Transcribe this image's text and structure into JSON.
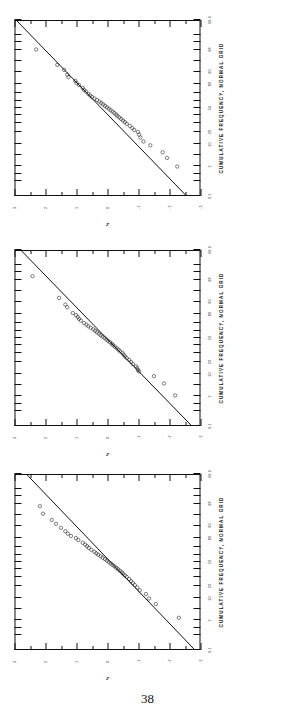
{
  "page": {
    "number": "38"
  },
  "axis": {
    "x_title": "CUMULATIVE FREQUENCY, NORMAL GRID",
    "y_title": "z",
    "x_ticks": [
      "0.1",
      "2",
      "10",
      "20",
      "50",
      "80",
      "90",
      "98",
      "99.9"
    ],
    "y_ticks": [
      "-3",
      "-2",
      "-1",
      "0",
      "1",
      "2",
      "3"
    ]
  },
  "chart_data": [
    {
      "type": "scatter",
      "title": "",
      "subtitle": "Normal probability plot A",
      "xlabel": "CUMULATIVE FREQUENCY, NORMAL GRID",
      "ylabel": "z",
      "xscale": "probability",
      "xlim": [
        0.1,
        99.9
      ],
      "ylim": [
        -3,
        3
      ],
      "grid": false,
      "legend": "none",
      "xticks": [
        0.1,
        2,
        10,
        20,
        50,
        80,
        90,
        98,
        99.9
      ],
      "yticks": [
        -3,
        -2,
        -1,
        0,
        1,
        2,
        3
      ],
      "fit_line": {
        "x": [
          0.1,
          99.9
        ],
        "y": [
          -2.55,
          2.95
        ]
      },
      "points": [
        {
          "p": 2.0,
          "z": -2.25
        },
        {
          "p": 4.0,
          "z": -1.92
        },
        {
          "p": 6.0,
          "z": -1.78
        },
        {
          "p": 9.5,
          "z": -1.38
        },
        {
          "p": 12.0,
          "z": -1.16
        },
        {
          "p": 15.0,
          "z": -1.06
        },
        {
          "p": 17.5,
          "z": -1.02
        },
        {
          "p": 20.0,
          "z": -0.98
        },
        {
          "p": 22.0,
          "z": -0.86
        },
        {
          "p": 24.0,
          "z": -0.8
        },
        {
          "p": 26.5,
          "z": -0.72
        },
        {
          "p": 29.0,
          "z": -0.62
        },
        {
          "p": 31.0,
          "z": -0.56
        },
        {
          "p": 33.0,
          "z": -0.5
        },
        {
          "p": 35.0,
          "z": -0.44
        },
        {
          "p": 37.0,
          "z": -0.38
        },
        {
          "p": 39.0,
          "z": -0.32
        },
        {
          "p": 41.0,
          "z": -0.28
        },
        {
          "p": 43.0,
          "z": -0.22
        },
        {
          "p": 45.0,
          "z": -0.16
        },
        {
          "p": 47.0,
          "z": -0.1
        },
        {
          "p": 49.0,
          "z": -0.04
        },
        {
          "p": 51.0,
          "z": 0.02
        },
        {
          "p": 53.0,
          "z": 0.08
        },
        {
          "p": 55.0,
          "z": 0.14
        },
        {
          "p": 57.0,
          "z": 0.2
        },
        {
          "p": 59.0,
          "z": 0.26
        },
        {
          "p": 61.0,
          "z": 0.34
        },
        {
          "p": 63.0,
          "z": 0.42
        },
        {
          "p": 65.0,
          "z": 0.5
        },
        {
          "p": 67.0,
          "z": 0.56
        },
        {
          "p": 69.0,
          "z": 0.62
        },
        {
          "p": 72.0,
          "z": 0.7
        },
        {
          "p": 74.0,
          "z": 0.76
        },
        {
          "p": 76.0,
          "z": 0.8
        },
        {
          "p": 79.0,
          "z": 0.92
        },
        {
          "p": 81.0,
          "z": 1.0
        },
        {
          "p": 83.0,
          "z": 1.04
        },
        {
          "p": 86.0,
          "z": 1.26
        },
        {
          "p": 88.0,
          "z": 1.3
        },
        {
          "p": 91.0,
          "z": 1.4
        },
        {
          "p": 93.5,
          "z": 1.62
        },
        {
          "p": 98.0,
          "z": 2.3
        }
      ]
    },
    {
      "type": "scatter",
      "title": "",
      "subtitle": "Normal probability plot B",
      "xlabel": "CUMULATIVE FREQUENCY, NORMAL GRID",
      "ylabel": "z",
      "xscale": "probability",
      "xlim": [
        0.1,
        99.9
      ],
      "ylim": [
        -3,
        3
      ],
      "grid": false,
      "legend": "none",
      "xticks": [
        0.1,
        2,
        10,
        20,
        50,
        80,
        90,
        98,
        99.9
      ],
      "yticks": [
        -3,
        -2,
        -1,
        0,
        1,
        2,
        3
      ],
      "fit_line": {
        "x": [
          0.1,
          99.9
        ],
        "y": [
          -2.72,
          2.8
        ]
      },
      "points": [
        {
          "p": 2.2,
          "z": -2.18
        },
        {
          "p": 5.5,
          "z": -1.82
        },
        {
          "p": 9.0,
          "z": -1.5
        },
        {
          "p": 12.0,
          "z": -1.02
        },
        {
          "p": 13.0,
          "z": -0.98
        },
        {
          "p": 14.5,
          "z": -0.96
        },
        {
          "p": 16.0,
          "z": -0.92
        },
        {
          "p": 18.0,
          "z": -0.82
        },
        {
          "p": 20.0,
          "z": -0.76
        },
        {
          "p": 22.0,
          "z": -0.7
        },
        {
          "p": 24.0,
          "z": -0.62
        },
        {
          "p": 26.0,
          "z": -0.56
        },
        {
          "p": 28.0,
          "z": -0.52
        },
        {
          "p": 30.0,
          "z": -0.48
        },
        {
          "p": 32.0,
          "z": -0.4
        },
        {
          "p": 34.0,
          "z": -0.36
        },
        {
          "p": 36.0,
          "z": -0.3
        },
        {
          "p": 38.0,
          "z": -0.24
        },
        {
          "p": 40.0,
          "z": -0.18
        },
        {
          "p": 42.0,
          "z": -0.14
        },
        {
          "p": 44.0,
          "z": -0.08
        },
        {
          "p": 46.0,
          "z": -0.02
        },
        {
          "p": 48.0,
          "z": 0.04
        },
        {
          "p": 50.0,
          "z": 0.1
        },
        {
          "p": 52.0,
          "z": 0.16
        },
        {
          "p": 54.0,
          "z": 0.22
        },
        {
          "p": 56.0,
          "z": 0.28
        },
        {
          "p": 58.0,
          "z": 0.34
        },
        {
          "p": 60.0,
          "z": 0.4
        },
        {
          "p": 62.0,
          "z": 0.46
        },
        {
          "p": 64.0,
          "z": 0.54
        },
        {
          "p": 66.0,
          "z": 0.62
        },
        {
          "p": 68.0,
          "z": 0.68
        },
        {
          "p": 70.0,
          "z": 0.76
        },
        {
          "p": 73.0,
          "z": 0.86
        },
        {
          "p": 75.0,
          "z": 0.92
        },
        {
          "p": 77.0,
          "z": 0.96
        },
        {
          "p": 79.0,
          "z": 1.02
        },
        {
          "p": 81.0,
          "z": 1.12
        },
        {
          "p": 86.0,
          "z": 1.3
        },
        {
          "p": 88.0,
          "z": 1.36
        },
        {
          "p": 92.0,
          "z": 1.56
        },
        {
          "p": 98.5,
          "z": 2.42
        }
      ]
    },
    {
      "type": "scatter",
      "title": "",
      "subtitle": "Normal probability plot C",
      "xlabel": "CUMULATIVE FREQUENCY, NORMAL GRID",
      "ylabel": "z",
      "xscale": "probability",
      "xlim": [
        0.1,
        99.9
      ],
      "ylim": [
        -3,
        3
      ],
      "grid": false,
      "legend": "none",
      "xticks": [
        0.1,
        2,
        10,
        20,
        50,
        80,
        90,
        98,
        99.9
      ],
      "yticks": [
        -3,
        -2,
        -1,
        0,
        1,
        2,
        3
      ],
      "fit_line": {
        "x": [
          0.1,
          99.9
        ],
        "y": [
          -2.82,
          2.62
        ]
      },
      "points": [
        {
          "p": 2.5,
          "z": -2.3
        },
        {
          "p": 7.0,
          "z": -1.56
        },
        {
          "p": 10.0,
          "z": -1.34
        },
        {
          "p": 13.0,
          "z": -1.24
        },
        {
          "p": 16.0,
          "z": -1.04
        },
        {
          "p": 18.5,
          "z": -0.96
        },
        {
          "p": 21.0,
          "z": -0.88
        },
        {
          "p": 23.0,
          "z": -0.82
        },
        {
          "p": 25.0,
          "z": -0.76
        },
        {
          "p": 27.5,
          "z": -0.7
        },
        {
          "p": 30.0,
          "z": -0.62
        },
        {
          "p": 32.0,
          "z": -0.56
        },
        {
          "p": 34.0,
          "z": -0.5
        },
        {
          "p": 36.0,
          "z": -0.46
        },
        {
          "p": 38.0,
          "z": -0.4
        },
        {
          "p": 40.0,
          "z": -0.34
        },
        {
          "p": 42.0,
          "z": -0.28
        },
        {
          "p": 44.0,
          "z": -0.22
        },
        {
          "p": 46.0,
          "z": -0.16
        },
        {
          "p": 48.0,
          "z": -0.1
        },
        {
          "p": 50.0,
          "z": -0.04
        },
        {
          "p": 52.0,
          "z": 0.02
        },
        {
          "p": 54.0,
          "z": 0.08
        },
        {
          "p": 56.0,
          "z": 0.16
        },
        {
          "p": 58.0,
          "z": 0.22
        },
        {
          "p": 60.0,
          "z": 0.3
        },
        {
          "p": 62.0,
          "z": 0.36
        },
        {
          "p": 64.0,
          "z": 0.42
        },
        {
          "p": 66.5,
          "z": 0.52
        },
        {
          "p": 69.0,
          "z": 0.6
        },
        {
          "p": 71.0,
          "z": 0.66
        },
        {
          "p": 73.0,
          "z": 0.72
        },
        {
          "p": 75.0,
          "z": 0.8
        },
        {
          "p": 78.0,
          "z": 0.94
        },
        {
          "p": 80.0,
          "z": 1.02
        },
        {
          "p": 82.0,
          "z": 1.18
        },
        {
          "p": 84.0,
          "z": 1.28
        },
        {
          "p": 86.0,
          "z": 1.36
        },
        {
          "p": 88.5,
          "z": 1.5
        },
        {
          "p": 91.0,
          "z": 1.66
        },
        {
          "p": 93.0,
          "z": 1.8
        },
        {
          "p": 95.5,
          "z": 2.08
        },
        {
          "p": 97.5,
          "z": 2.18
        }
      ]
    }
  ]
}
